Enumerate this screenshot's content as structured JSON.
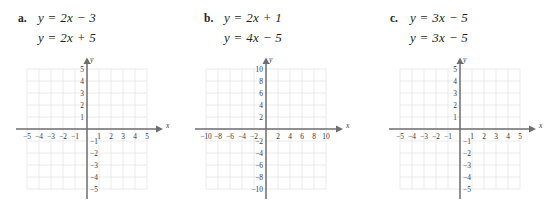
{
  "exercises": [
    {
      "letter": "a.",
      "equations": [
        "y = 2x − 3",
        "y = 2x + 5"
      ],
      "graph": {
        "x_axis_label": "x",
        "y_axis_label": "y",
        "x_ticks": [
          "−5",
          "−4",
          "−3",
          "−2",
          "−1",
          "1",
          "2",
          "3",
          "4",
          "5"
        ],
        "y_ticks": [
          "5",
          "4",
          "3",
          "2",
          "1",
          "−1",
          "−2",
          "−3",
          "−4",
          "−5"
        ],
        "xlim": [
          -5,
          5
        ],
        "ylim": [
          -5,
          5
        ],
        "step": 1,
        "grid": true
      }
    },
    {
      "letter": "b.",
      "equations": [
        "y = 2x + 1",
        "y = 4x − 5"
      ],
      "graph": {
        "x_axis_label": "x",
        "y_axis_label": "y",
        "x_ticks": [
          "−10",
          "−8",
          "−6",
          "−4",
          "−2",
          "2",
          "4",
          "6",
          "8",
          "10"
        ],
        "y_ticks": [
          "10",
          "8",
          "6",
          "4",
          "2",
          "−2",
          "−4",
          "−6",
          "−8",
          "−10"
        ],
        "xlim": [
          -10,
          10
        ],
        "ylim": [
          -10,
          10
        ],
        "step": 2,
        "grid": true
      }
    },
    {
      "letter": "c.",
      "equations": [
        "y = 3x − 5",
        "y = 3x − 5"
      ],
      "graph": {
        "x_axis_label": "x",
        "y_axis_label": "y",
        "x_ticks": [
          "−5",
          "−4",
          "−3",
          "−2",
          "−1",
          "1",
          "2",
          "3",
          "4",
          "5"
        ],
        "y_ticks": [
          "5",
          "4",
          "3",
          "2",
          "1",
          "−1",
          "−2",
          "−3",
          "−4",
          "−5"
        ],
        "xlim": [
          -5,
          5
        ],
        "ylim": [
          -5,
          5
        ],
        "step": 1,
        "grid": true
      }
    }
  ],
  "colors": {
    "gridline": "#e2e2e4",
    "axis": "#6e6e72",
    "text": "#231f20"
  }
}
